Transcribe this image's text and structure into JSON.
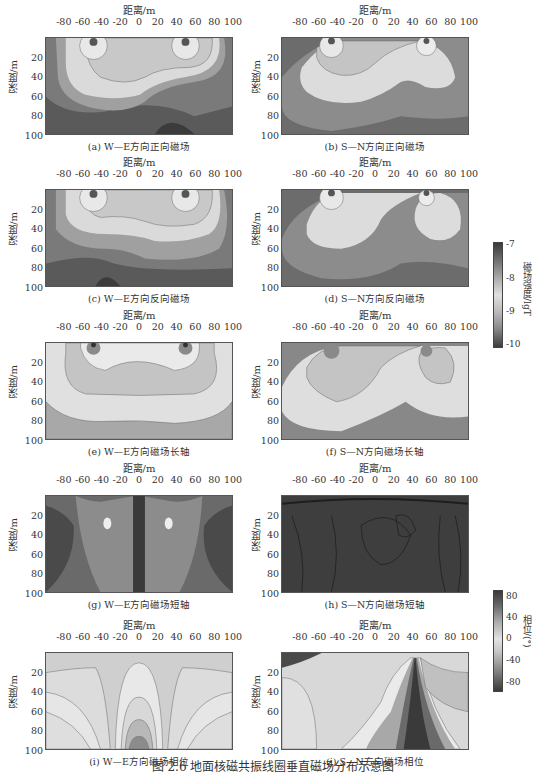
{
  "figure": {
    "caption": "图 2.6   地面核磁共振线圈垂直磁场分布示意图"
  },
  "axes": {
    "xlabel": "距离/m",
    "ylabel": "深度/m",
    "xticks": [
      "-80",
      "-60",
      "-40",
      "-20",
      "0",
      "20",
      "40",
      "60",
      "80",
      "100"
    ],
    "yticks": [
      "20",
      "40",
      "60",
      "80",
      "100"
    ]
  },
  "panels": [
    {
      "id": "a",
      "caption": "(a) W—E方向正向磁场"
    },
    {
      "id": "b",
      "caption": "(b) S—N方向正向磁场"
    },
    {
      "id": "c",
      "caption": "(c) W—E方向反向磁场"
    },
    {
      "id": "d",
      "caption": "(d) S—N方向反向磁场"
    },
    {
      "id": "e",
      "caption": "(e) W—E方向磁场长轴"
    },
    {
      "id": "f",
      "caption": "(f) S—N方向磁场长轴"
    },
    {
      "id": "g",
      "caption": "(g) W—E方向磁场短轴"
    },
    {
      "id": "h",
      "caption": "(h) S—N方向磁场短轴"
    },
    {
      "id": "i",
      "caption": "(i) W—E方向磁场相位"
    },
    {
      "id": "j",
      "caption": "(j) S—N方向磁场相位"
    }
  ],
  "colorbars": [
    {
      "label": "磁场强度/lgT",
      "ticks": [
        "-7",
        "-8",
        "-9",
        "-10"
      ],
      "range": [
        -10,
        -7
      ]
    },
    {
      "label": "相位/(°)",
      "ticks": [
        "80",
        "40",
        "0",
        "-40",
        "-80"
      ],
      "range": [
        -90,
        90
      ]
    }
  ],
  "chart_data": [
    {
      "type": "heatmap",
      "panel": "a",
      "title": "(a) W—E方向正向磁场",
      "xlabel": "距离/m",
      "ylabel": "深度/m",
      "xlim": [
        -100,
        100
      ],
      "ylim": [
        0,
        100
      ],
      "colorbar": "磁场强度/lgT",
      "clim": [
        -10,
        -7
      ],
      "features": "two coil-edge maxima near x=-45 and x=50 at surface; broad light lobe 20-70 m deep; dark region lower right near x=30, depth 90-100"
    },
    {
      "type": "heatmap",
      "panel": "b",
      "title": "(b) S—N方向正向磁场",
      "xlabel": "距离/m",
      "ylabel": "深度/m",
      "xlim": [
        -100,
        100
      ],
      "ylim": [
        0,
        100
      ],
      "colorbar": "磁场强度/lgT",
      "clim": [
        -10,
        -7
      ],
      "features": "asymmetric teardrop lobes centered x=-45 and x=50"
    },
    {
      "type": "heatmap",
      "panel": "c",
      "title": "(c) W—E方向反向磁场",
      "xlabel": "距离/m",
      "ylabel": "深度/m",
      "xlim": [
        -100,
        100
      ],
      "ylim": [
        0,
        100
      ],
      "colorbar": "磁场强度/lgT",
      "clim": [
        -10,
        -7
      ],
      "features": "mirror of (a); dark region lower left near x=-30"
    },
    {
      "type": "heatmap",
      "panel": "d",
      "title": "(d) S—N方向反向磁场",
      "xlabel": "距离/m",
      "ylabel": "深度/m",
      "xlim": [
        -100,
        100
      ],
      "ylim": [
        0,
        100
      ],
      "colorbar": "磁场强度/lgT",
      "clim": [
        -10,
        -7
      ]
    },
    {
      "type": "heatmap",
      "panel": "e",
      "title": "(e) W—E方向磁场长轴",
      "xlabel": "距离/m",
      "ylabel": "深度/m",
      "xlim": [
        -100,
        100
      ],
      "ylim": [
        0,
        100
      ],
      "colorbar": "磁场强度/lgT",
      "clim": [
        -10,
        -7
      ],
      "features": "symmetric banded contours, bands end near 55 m and 85 m depth"
    },
    {
      "type": "heatmap",
      "panel": "f",
      "title": "(f) S—N方向磁场长轴",
      "xlabel": "距离/m",
      "ylabel": "深度/m",
      "xlim": [
        -100,
        100
      ],
      "ylim": [
        0,
        100
      ],
      "colorbar": "磁场强度/lgT",
      "clim": [
        -10,
        -7
      ]
    },
    {
      "type": "heatmap",
      "panel": "g",
      "title": "(g) W—E方向磁场短轴",
      "xlabel": "距离/m",
      "ylabel": "深度/m",
      "xlim": [
        -100,
        100
      ],
      "ylim": [
        0,
        100
      ],
      "colorbar": "磁场强度/lgT",
      "clim": [
        -10,
        -7
      ],
      "features": "two light lobes either side of x=0, small bright spots near (-30,30) and (30,30)"
    },
    {
      "type": "heatmap",
      "panel": "h",
      "title": "(h) S—N方向磁场短轴",
      "xlabel": "距离/m",
      "ylabel": "深度/m",
      "xlim": [
        -100,
        100
      ],
      "ylim": [
        0,
        100
      ],
      "colorbar": "磁场强度/lgT",
      "clim": [
        -10,
        -7
      ],
      "features": "uniformly dark with contour loops"
    },
    {
      "type": "heatmap",
      "panel": "i",
      "title": "(i) W—E方向磁场相位",
      "xlabel": "距离/m",
      "ylabel": "深度/m",
      "xlim": [
        -100,
        100
      ],
      "ylim": [
        0,
        100
      ],
      "colorbar": "相位/(°)",
      "clim": [
        -90,
        90
      ],
      "features": "symmetric light fans, central dome darkening to bottom at x=0"
    },
    {
      "type": "heatmap",
      "panel": "j",
      "title": "(j) S—N方向磁场相位",
      "xlabel": "距离/m",
      "ylabel": "深度/m",
      "xlim": [
        -100,
        100
      ],
      "ylim": [
        0,
        100
      ],
      "colorbar": "相位/(°)",
      "clim": [
        -90,
        90
      ],
      "features": "dark fan diverging from surface near x=40 down to x=10-70 at 100 m"
    }
  ]
}
